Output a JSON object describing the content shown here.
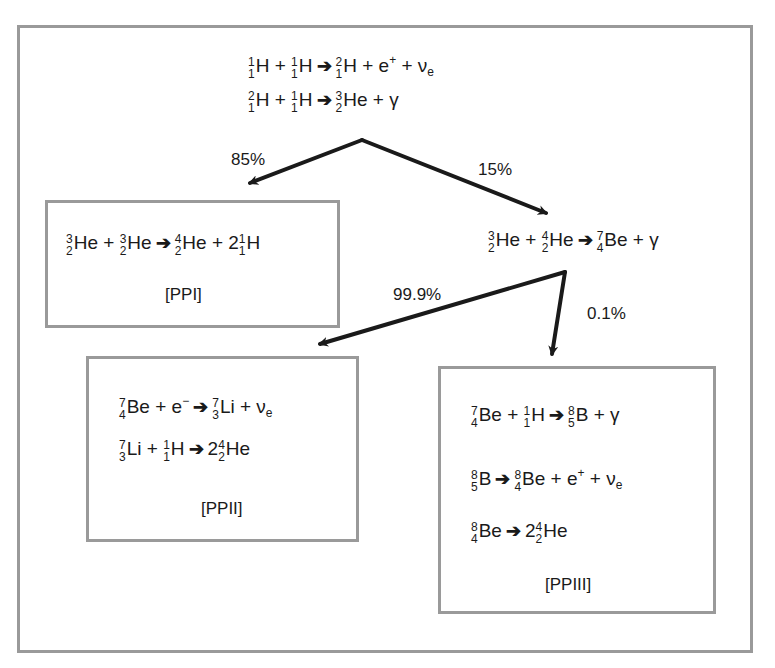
{
  "arrow_glyph": "➔",
  "top_reactions": [
    {
      "terms": [
        {
          "mass": "1",
          "z": "1",
          "sym": "H"
        },
        {
          "op": "+"
        },
        {
          "mass": "1",
          "z": "1",
          "sym": "H"
        },
        {
          "arrow": true
        },
        {
          "mass": "2",
          "z": "1",
          "sym": "H"
        },
        {
          "op": "+"
        },
        {
          "text": "e",
          "sup": "+"
        },
        {
          "op": "+"
        },
        {
          "text": "ν",
          "sub": "e"
        }
      ]
    },
    {
      "terms": [
        {
          "mass": "2",
          "z": "1",
          "sym": "H"
        },
        {
          "op": "+"
        },
        {
          "mass": "1",
          "z": "1",
          "sym": "H"
        },
        {
          "arrow": true
        },
        {
          "mass": "3",
          "z": "2",
          "sym": "He"
        },
        {
          "op": "+"
        },
        {
          "text": "γ"
        }
      ]
    }
  ],
  "branches": {
    "first_split": {
      "left_pct": "85%",
      "right_pct": "15%"
    },
    "second_split": {
      "left_pct": "99.9%",
      "right_pct": "0.1%"
    }
  },
  "intermediate_reaction": {
    "terms": [
      {
        "mass": "3",
        "z": "2",
        "sym": "He"
      },
      {
        "op": "+"
      },
      {
        "mass": "4",
        "z": "2",
        "sym": "He"
      },
      {
        "arrow": true
      },
      {
        "mass": "7",
        "z": "4",
        "sym": "Be"
      },
      {
        "op": "+"
      },
      {
        "text": "γ"
      }
    ]
  },
  "boxes": {
    "ppi": {
      "label": "[PPI]",
      "reactions": [
        {
          "terms": [
            {
              "mass": "3",
              "z": "2",
              "sym": "He"
            },
            {
              "op": "+"
            },
            {
              "mass": "3",
              "z": "2",
              "sym": "He"
            },
            {
              "arrow": true
            },
            {
              "mass": "4",
              "z": "2",
              "sym": "He"
            },
            {
              "op": "+"
            },
            {
              "coef": "2",
              "mass": "1",
              "z": "1",
              "sym": "H"
            }
          ]
        }
      ]
    },
    "ppii": {
      "label": "[PPII]",
      "reactions": [
        {
          "terms": [
            {
              "mass": "7",
              "z": "4",
              "sym": "Be"
            },
            {
              "op": "+"
            },
            {
              "text": "e",
              "sup": "−"
            },
            {
              "arrow": true
            },
            {
              "mass": "7",
              "z": "3",
              "sym": "Li"
            },
            {
              "op": "+"
            },
            {
              "text": "ν",
              "sub": "e"
            }
          ]
        },
        {
          "terms": [
            {
              "mass": "7",
              "z": "3",
              "sym": "Li"
            },
            {
              "op": "+"
            },
            {
              "mass": "1",
              "z": "1",
              "sym": "H"
            },
            {
              "arrow": true
            },
            {
              "coef": "2",
              "mass": "4",
              "z": "2",
              "sym": "He"
            }
          ]
        }
      ]
    },
    "ppiii": {
      "label": "[PPIII]",
      "reactions": [
        {
          "terms": [
            {
              "mass": "7",
              "z": "4",
              "sym": "Be"
            },
            {
              "op": "+"
            },
            {
              "mass": "1",
              "z": "1",
              "sym": "H"
            },
            {
              "arrow": true
            },
            {
              "mass": "8",
              "z": "5",
              "sym": "B"
            },
            {
              "op": "+"
            },
            {
              "text": "γ"
            }
          ]
        },
        {
          "terms": [
            {
              "mass": "8",
              "z": "5",
              "sym": "B"
            },
            {
              "arrow": true
            },
            {
              "mass": "8",
              "z": "4",
              "sym": "Be"
            },
            {
              "op": "+"
            },
            {
              "text": "e",
              "sup": "+"
            },
            {
              "op": "+"
            },
            {
              "text": "ν",
              "sub": "e"
            }
          ]
        },
        {
          "terms": [
            {
              "mass": "8",
              "z": "4",
              "sym": "Be"
            },
            {
              "arrow": true
            },
            {
              "coef": "2",
              "mass": "4",
              "z": "2",
              "sym": "He"
            }
          ]
        }
      ]
    }
  },
  "colors": {
    "border": "#9a9a9a",
    "arrow": "#1a1a1a",
    "text": "#1a1a1a"
  }
}
